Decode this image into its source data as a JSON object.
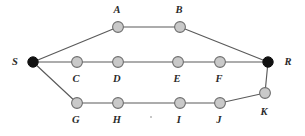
{
  "diagram": {
    "type": "node-link-graph",
    "canvas": {
      "width": 305,
      "height": 136,
      "background": "#ffffff"
    },
    "style": {
      "edge_color": "#5a5a5a",
      "node_fill": "#c9c9c9",
      "node_stroke": "#6e6e6e",
      "terminal_fill": "#111111",
      "label_color": "#2a2a2a"
    },
    "nodes": [
      {
        "id": "S",
        "label": "S",
        "x": 33,
        "y": 62,
        "r": 5.2,
        "kind": "filled",
        "label_x": 15,
        "label_y": 62
      },
      {
        "id": "A",
        "label": "A",
        "x": 118,
        "y": 27,
        "r": 5.4,
        "kind": "open",
        "label_x": 117,
        "label_y": 10
      },
      {
        "id": "B",
        "label": "B",
        "x": 180,
        "y": 27,
        "r": 5.4,
        "kind": "open",
        "label_x": 179,
        "label_y": 10
      },
      {
        "id": "C",
        "label": "C",
        "x": 77,
        "y": 62,
        "r": 5.4,
        "kind": "open",
        "label_x": 76,
        "label_y": 79
      },
      {
        "id": "D",
        "label": "D",
        "x": 118,
        "y": 62,
        "r": 5.4,
        "kind": "open",
        "label_x": 117,
        "label_y": 79
      },
      {
        "id": "E",
        "label": "E",
        "x": 178,
        "y": 62,
        "r": 5.4,
        "kind": "open",
        "label_x": 177,
        "label_y": 79
      },
      {
        "id": "F",
        "label": "F",
        "x": 220,
        "y": 62,
        "r": 5.4,
        "kind": "open",
        "label_x": 219,
        "label_y": 79
      },
      {
        "id": "R",
        "label": "R",
        "x": 268,
        "y": 62,
        "r": 5.2,
        "kind": "filled",
        "label_x": 288,
        "label_y": 62
      },
      {
        "id": "G",
        "label": "G",
        "x": 77,
        "y": 103,
        "r": 5.4,
        "kind": "open",
        "label_x": 76,
        "label_y": 120
      },
      {
        "id": "H",
        "label": "H",
        "x": 118,
        "y": 103,
        "r": 5.4,
        "kind": "open",
        "label_x": 117,
        "label_y": 120
      },
      {
        "id": "I",
        "label": "I",
        "x": 180,
        "y": 103,
        "r": 5.4,
        "kind": "open",
        "label_x": 179,
        "label_y": 120
      },
      {
        "id": "J",
        "label": "J",
        "x": 220,
        "y": 103,
        "r": 5.4,
        "kind": "open",
        "label_x": 219,
        "label_y": 120
      },
      {
        "id": "K",
        "label": "K",
        "x": 265,
        "y": 93,
        "r": 5.4,
        "kind": "open",
        "label_x": 264,
        "label_y": 112
      }
    ],
    "edges": [
      {
        "from": "S",
        "to": "A"
      },
      {
        "from": "A",
        "to": "B"
      },
      {
        "from": "B",
        "to": "R"
      },
      {
        "from": "S",
        "to": "C"
      },
      {
        "from": "C",
        "to": "D"
      },
      {
        "from": "D",
        "to": "E"
      },
      {
        "from": "E",
        "to": "F"
      },
      {
        "from": "F",
        "to": "R"
      },
      {
        "from": "S",
        "to": "G"
      },
      {
        "from": "G",
        "to": "H"
      },
      {
        "from": "H",
        "to": "I"
      },
      {
        "from": "I",
        "to": "J"
      },
      {
        "from": "J",
        "to": "K"
      },
      {
        "from": "K",
        "to": "R"
      }
    ],
    "specks": [
      {
        "x": 150,
        "y": 116
      }
    ]
  }
}
